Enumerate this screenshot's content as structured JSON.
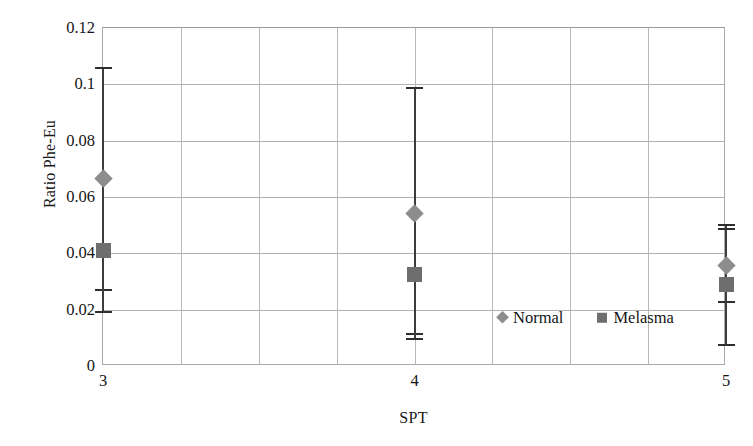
{
  "chart_data": {
    "type": "scatter",
    "title": "",
    "xlabel": "SPT",
    "ylabel": "Ratio Phe-Eu",
    "x": [
      3,
      4,
      5
    ],
    "xtick_labels": [
      "3",
      "4",
      "5"
    ],
    "ytick_labels": [
      "0",
      "0.02",
      "0.04",
      "0.06",
      "0.08",
      "0.1",
      "0.12"
    ],
    "ytick_values": [
      0,
      0.02,
      0.04,
      0.06,
      0.08,
      0.1,
      0.12
    ],
    "ylim": [
      0,
      0.12
    ],
    "xlim": [
      3,
      5
    ],
    "grid": "both",
    "legend_position": "inside-bottom-right",
    "error_bars": true,
    "series": [
      {
        "name": "Normal",
        "marker": "diamond",
        "color": "#8d8d8d",
        "values": [
          0.0667,
          0.0543,
          0.0358
        ],
        "err_upper": [
          0.1063,
          0.099,
          0.0505
        ],
        "err_lower": [
          0.0273,
          0.0117,
          0.023
        ]
      },
      {
        "name": "Melasma",
        "marker": "square",
        "color": "#6e6e6e",
        "values": [
          0.0411,
          0.0326,
          0.029
        ],
        "err_upper": [
          0.1063,
          0.099,
          0.049
        ],
        "err_lower": [
          0.0195,
          0.0099,
          0.0078
        ]
      }
    ],
    "legend": [
      {
        "label": "Normal",
        "marker": "diamond",
        "color": "#8d8d8d"
      },
      {
        "label": "Melasma",
        "marker": "square",
        "color": "#6e6e6e"
      }
    ],
    "axis_color": "#a9a9a9",
    "gridline_color": "#b2b2b2",
    "errorbar_color": "#3d3d3d"
  }
}
